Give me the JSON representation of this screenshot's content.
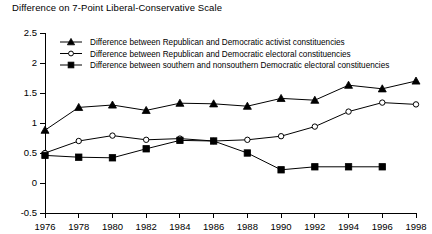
{
  "chart_data": {
    "type": "line",
    "title": "Difference on 7-Point Liberal-Conservative Scale",
    "xlabel": "",
    "ylabel": "",
    "x": [
      1976,
      1978,
      1980,
      1982,
      1984,
      1986,
      1988,
      1990,
      1992,
      1994,
      1996,
      1998
    ],
    "xtick_labels": [
      "1976",
      "1978",
      "1980",
      "1982",
      "1984",
      "1986",
      "1988",
      "1990",
      "1992",
      "1994",
      "1996",
      "1998"
    ],
    "ytick_labels": [
      "2.5",
      "2",
      "1.5",
      "1",
      "0.5",
      "0",
      "-0.5"
    ],
    "ytick_values": [
      2.5,
      2,
      1.5,
      1,
      0.5,
      0,
      -0.5
    ],
    "ylim": [
      -0.5,
      2.5
    ],
    "xlim": [
      1976,
      1998
    ],
    "grid": false,
    "legend_position": "top-left-inside",
    "series": [
      {
        "name": "Difference between Republican and Democratic activist constituencies",
        "marker": "triangle-filled",
        "values": [
          0.88,
          1.26,
          1.3,
          1.21,
          1.33,
          1.32,
          1.28,
          1.41,
          1.38,
          1.63,
          1.57,
          1.7
        ]
      },
      {
        "name": "Difference between Republican and Democratic electoral constituencies",
        "marker": "circle-open",
        "values": [
          0.5,
          0.7,
          0.79,
          0.72,
          0.74,
          0.7,
          0.72,
          0.78,
          0.94,
          1.19,
          1.34,
          1.31
        ]
      },
      {
        "name": "Difference between southern and nonsouthern Democratic electoral constituencies",
        "marker": "square-filled",
        "values": [
          0.46,
          0.43,
          0.42,
          0.57,
          0.71,
          0.7,
          0.5,
          0.22,
          0.27,
          0.27,
          0.27,
          null
        ]
      }
    ]
  },
  "legend": {
    "items": [
      {
        "label": "Difference between Republican and Democratic activist constituencies",
        "marker": "triangle-filled"
      },
      {
        "label": "Difference between Republican and Democratic electoral constituencies",
        "marker": "circle-open"
      },
      {
        "label": "Difference between southern and nonsouthern Democratic electoral constituencies",
        "marker": "square-filled"
      }
    ]
  },
  "colors": {
    "ink": "#000000",
    "background": "#ffffff"
  }
}
